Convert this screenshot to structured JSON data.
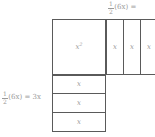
{
  "figure": {
    "line_color": "#5a5a5a",
    "text_color": "#9a9a9a",
    "background": "#ffffff"
  },
  "labels": {
    "top": {
      "numerator": "1",
      "denominator": "2",
      "expression": "(6x) =",
      "truncated": true
    },
    "left": {
      "numerator": "1",
      "denominator": "2",
      "expression": "(6x) = 3x",
      "truncated": false
    }
  },
  "tiles": {
    "square": {
      "label": "x",
      "exponent": "2"
    },
    "right_strips": [
      {
        "label": "x"
      },
      {
        "label": "x"
      },
      {
        "label": "x"
      }
    ],
    "bottom_strips": [
      {
        "label": "x"
      },
      {
        "label": "x"
      },
      {
        "label": "x"
      }
    ]
  }
}
